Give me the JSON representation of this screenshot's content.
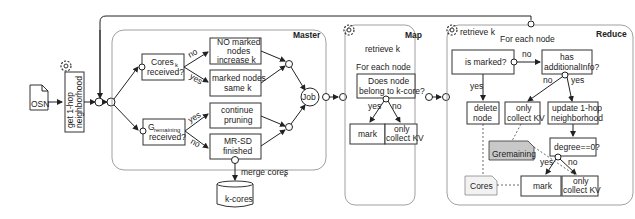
{
  "diagram": {
    "input": {
      "label": "OSN"
    },
    "preprocess": {
      "label_line1": "get 1-hop",
      "label_line2": "neighborhood"
    },
    "master": {
      "title": "Master",
      "cores_decision": {
        "line1": "Cores",
        "line1_sub": "k",
        "line2": "received?"
      },
      "gremaining_decision": {
        "line1": "G",
        "line1_sub": "remaining",
        "line2": "received?"
      },
      "edge_labels": {
        "cores_no": "no",
        "cores_yes": "yes",
        "grem_yes": "yes",
        "grem_no": "no"
      },
      "no_marked": {
        "line1": "NO marked",
        "line2": "nodes",
        "line3": "increase k"
      },
      "marked_same": {
        "line1": "marked nodes",
        "line2": "same k"
      },
      "continue_pruning": {
        "line1": "continue",
        "line2": "pruning"
      },
      "mrsd_finished": {
        "line1": "MR-SD",
        "line2": "finished"
      },
      "job": {
        "label": "Job"
      },
      "merge_label": {
        "text": "merge cores",
        "sub": "k"
      },
      "kcores_db": {
        "label": "k-cores"
      }
    },
    "map": {
      "title": "Map",
      "retrieve": "retrieve k",
      "for_each": {
        "text": "For each node",
        "sub": "c",
        "suffix": ":"
      },
      "decision": {
        "line1": "Does node",
        "line1_sub": "c",
        "line2": "belong to k-core?"
      },
      "edge_yes": "yes",
      "edge_no": "no",
      "mark": "mark",
      "only_collect": {
        "line1": "only",
        "line2": "collect KV"
      }
    },
    "reduce": {
      "title": "Reduce",
      "retrieve": "retrieve k",
      "for_each": {
        "text": "For each node",
        "sub": "c",
        "suffix": ":"
      },
      "is_marked": "is marked?",
      "edge_no_1": "no",
      "has_info": {
        "line1": "has",
        "line2": "additionalInfo?"
      },
      "edge_yes_1": "yes",
      "edge_no_2": "no",
      "edge_yes_2": "yes",
      "delete_node": {
        "line1": "delete",
        "line2": "node",
        "line2_sub": "c"
      },
      "only_collect_1": {
        "line1": "only",
        "line2": "collect KV"
      },
      "update_hop": {
        "line1": "update 1-hop",
        "line2": "neighborhood"
      },
      "degree_zero": "degree==0?",
      "edge_yes_3": "yes",
      "edge_no_3": "no",
      "gremaining_doc": "Gremaining",
      "cores_doc": {
        "text": "Cores",
        "sub": "k"
      },
      "mark": "mark",
      "only_collect_2": {
        "line1": "only",
        "line2": "collect KV"
      }
    },
    "colors": {
      "gremaining_fill": "#c8c8c8",
      "cores_fill": "#f2f2f2",
      "panel_stroke": "#888888",
      "line": "#222222"
    }
  }
}
